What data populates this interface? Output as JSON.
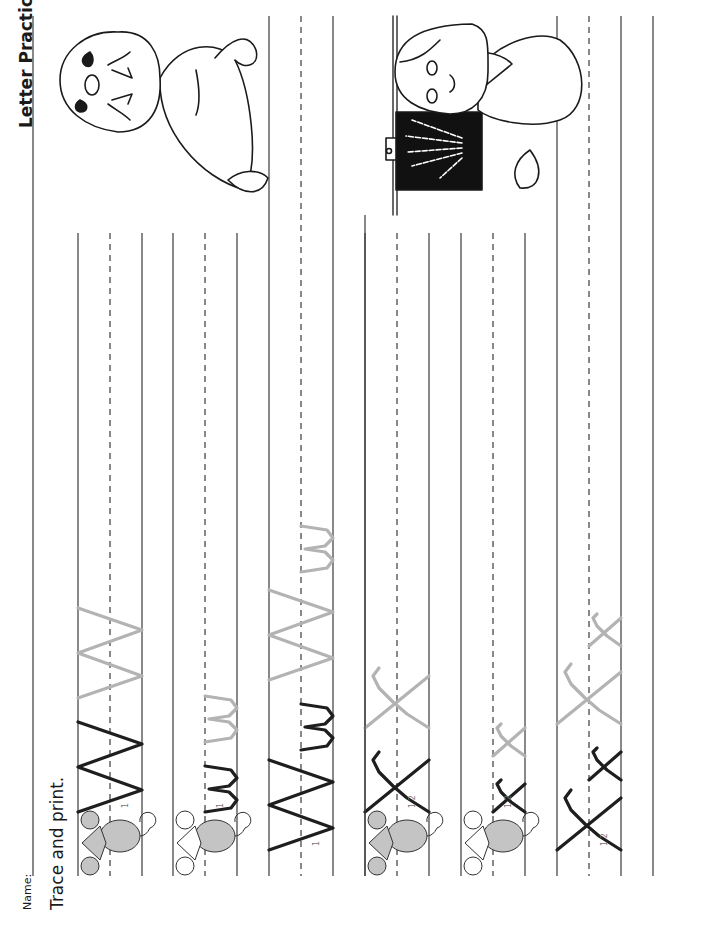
{
  "header": {
    "title": "Letter Practice",
    "name_label": "Name:",
    "instruction": "Trace and print."
  },
  "colors": {
    "line": "#3a3a3a",
    "model_stroke": "#1e1e1e",
    "trace_stroke": "#b3b3b3",
    "mouse_fill": "#c4c4c4",
    "xray_bg": "#111111"
  },
  "sections": [
    {
      "letter": "W",
      "illustration": "walrus",
      "rows": [
        {
          "model": "W",
          "trace": [
            "W"
          ],
          "mouse": "gray-head",
          "stroke_hint": "1"
        },
        {
          "model": "w",
          "trace": [
            "w"
          ],
          "mouse": "white-head",
          "stroke_hint": "1"
        },
        {
          "model": "Ww",
          "trace": [
            "W",
            "w"
          ],
          "mouse": "none",
          "stroke_hint": "1"
        }
      ]
    },
    {
      "letter": "X",
      "illustration": "doctor-with-x-ray",
      "rows": [
        {
          "model": "X",
          "trace": [
            "X"
          ],
          "mouse": "gray-head",
          "stroke_hint": "1 2"
        },
        {
          "model": "x",
          "trace": [
            "x"
          ],
          "mouse": "white-head",
          "stroke_hint": "1 2"
        },
        {
          "model": "Xx",
          "trace": [
            "X",
            "x"
          ],
          "mouse": "none",
          "stroke_hint": "1 2"
        }
      ]
    }
  ]
}
